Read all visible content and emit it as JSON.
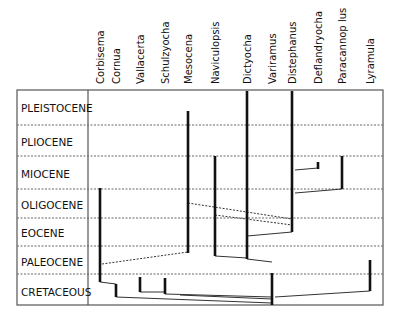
{
  "diagram": {
    "type": "stratigraphic-range-phylogeny",
    "frame": {
      "left": 17,
      "top": 90,
      "right": 383,
      "bottom": 305,
      "label_divider_x": 88
    },
    "epochs": [
      {
        "name": "PLEISTOCENE",
        "label_y": 108
      },
      {
        "name": "PLIOCENE",
        "label_y": 142
      },
      {
        "name": "MIOCENE",
        "label_y": 174
      },
      {
        "name": "OLIGOCENE",
        "label_y": 205
      },
      {
        "name": "EOCENE",
        "label_y": 233
      },
      {
        "name": "PALEOCENE",
        "label_y": 262
      },
      {
        "name": "CRETACEOUS",
        "label_y": 292
      }
    ],
    "boundaries_y": [
      125,
      156,
      189,
      218,
      246,
      274
    ],
    "taxa": [
      {
        "name": "Corbisema",
        "x": 100
      },
      {
        "name": "Cornua",
        "x": 116
      },
      {
        "name": "Vallacerta",
        "x": 140
      },
      {
        "name": "Schulzyocha",
        "x": 165
      },
      {
        "name": "Mesocena",
        "x": 188
      },
      {
        "name": "Naviculopsis",
        "x": 215
      },
      {
        "name": "Dictyocha",
        "x": 247
      },
      {
        "name": "Variramus",
        "x": 272
      },
      {
        "name": "Distephanus",
        "x": 292
      },
      {
        "name": "Deflandryocha",
        "x": 318
      },
      {
        "name": "Paracannop lus",
        "x": 342
      },
      {
        "name": "Lyramula",
        "x": 370
      }
    ],
    "ranges": [
      {
        "taxon": "Corbisema",
        "x": 100,
        "y1": 188,
        "y2": 282
      },
      {
        "taxon": "Cornua",
        "x": 116,
        "y1": 284,
        "y2": 297
      },
      {
        "taxon": "Vallacerta",
        "x": 140,
        "y1": 277,
        "y2": 292
      },
      {
        "taxon": "Schulzyocha",
        "x": 165,
        "y1": 278,
        "y2": 294
      },
      {
        "taxon": "Mesocena",
        "x": 188,
        "y1": 111,
        "y2": 253
      },
      {
        "taxon": "Naviculopsis",
        "x": 215,
        "y1": 156,
        "y2": 256
      },
      {
        "taxon": "Dictyocha",
        "x": 247,
        "y1": 91,
        "y2": 259
      },
      {
        "taxon": "Variramus",
        "x": 272,
        "y1": 273,
        "y2": 305
      },
      {
        "taxon": "Distephanus",
        "x": 292,
        "y1": 91,
        "y2": 232
      },
      {
        "taxon": "Deflandryocha",
        "x": 318,
        "y1": 162,
        "y2": 169
      },
      {
        "taxon": "Paracannop lus",
        "x": 342,
        "y1": 156,
        "y2": 189
      },
      {
        "taxon": "Lyramula",
        "x": 370,
        "y1": 260,
        "y2": 291
      }
    ],
    "links": [
      {
        "x1": 100,
        "y1": 282,
        "x2": 116,
        "y2": 284,
        "style": "solid"
      },
      {
        "x1": 116,
        "y1": 297,
        "x2": 272,
        "y2": 303,
        "style": "solid"
      },
      {
        "x1": 140,
        "y1": 292,
        "x2": 165,
        "y2": 292,
        "style": "solid"
      },
      {
        "x1": 165,
        "y1": 294,
        "x2": 272,
        "y2": 297,
        "style": "solid"
      },
      {
        "x1": 102,
        "y1": 264,
        "x2": 188,
        "y2": 252,
        "style": "dashed"
      },
      {
        "x1": 188,
        "y1": 203,
        "x2": 292,
        "y2": 219,
        "style": "dashed"
      },
      {
        "x1": 215,
        "y1": 215,
        "x2": 292,
        "y2": 225,
        "style": "dashed"
      },
      {
        "x1": 215,
        "y1": 256,
        "x2": 247,
        "y2": 258,
        "style": "solid"
      },
      {
        "x1": 247,
        "y1": 259,
        "x2": 272,
        "y2": 262,
        "style": "solid"
      },
      {
        "x1": 247,
        "y1": 236,
        "x2": 292,
        "y2": 232,
        "style": "solid"
      },
      {
        "x1": 180,
        "y1": 295,
        "x2": 272,
        "y2": 299,
        "style": "solid"
      },
      {
        "x1": 275,
        "y1": 297,
        "x2": 370,
        "y2": 291,
        "style": "solid"
      },
      {
        "x1": 295,
        "y1": 170,
        "x2": 318,
        "y2": 168,
        "style": "solid"
      },
      {
        "x1": 295,
        "y1": 193,
        "x2": 342,
        "y2": 189,
        "style": "solid"
      }
    ],
    "colors": {
      "line": "#111111",
      "frame": "#555555",
      "dotted": "#666666",
      "background": "#ffffff"
    }
  }
}
